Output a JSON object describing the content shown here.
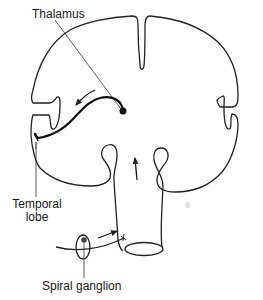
{
  "diagram": {
    "type": "anatomical-schematic",
    "labels": {
      "thalamus": "Thalamus",
      "temporal_lobe_line1": "Temporal",
      "temporal_lobe_line2": "lobe",
      "spiral_ganglion": "Spiral ganglion"
    },
    "colors": {
      "stroke": "#222222",
      "background": "#ffffff",
      "text": "#1a1a1a"
    },
    "elements": [
      {
        "id": "brain-outline",
        "kind": "outline"
      },
      {
        "id": "brainstem",
        "kind": "outline"
      },
      {
        "id": "thalamus-node",
        "kind": "dot"
      },
      {
        "id": "thalamocortical-pathway",
        "kind": "curve-arrow"
      },
      {
        "id": "ascending-arrow",
        "kind": "arrow"
      },
      {
        "id": "cochlear-nerve",
        "kind": "curve"
      },
      {
        "id": "spiral-ganglion-ellipse",
        "kind": "ellipse-with-dot"
      },
      {
        "id": "nerve-arrow",
        "kind": "arrow"
      }
    ]
  }
}
